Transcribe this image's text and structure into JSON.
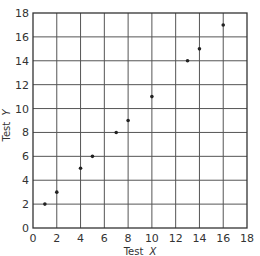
{
  "chart_data": {
    "type": "scatter",
    "title": "",
    "xlabel": "Test",
    "xlabel_var": "X",
    "ylabel": "Test",
    "ylabel_var": "Y",
    "xlim": [
      0,
      18
    ],
    "ylim": [
      0,
      18
    ],
    "x_ticks": [
      0,
      2,
      4,
      6,
      8,
      10,
      12,
      14,
      16,
      18
    ],
    "y_ticks": [
      0,
      2,
      4,
      6,
      8,
      10,
      12,
      14,
      16,
      18
    ],
    "grid": true,
    "legend": "none",
    "series": [
      {
        "name": "scores",
        "points": [
          {
            "x": 1,
            "y": 2
          },
          {
            "x": 2,
            "y": 3
          },
          {
            "x": 4,
            "y": 5
          },
          {
            "x": 5,
            "y": 6
          },
          {
            "x": 7,
            "y": 8
          },
          {
            "x": 8,
            "y": 9
          },
          {
            "x": 10,
            "y": 11
          },
          {
            "x": 13,
            "y": 14
          },
          {
            "x": 14,
            "y": 15
          },
          {
            "x": 16,
            "y": 17
          }
        ]
      }
    ]
  }
}
